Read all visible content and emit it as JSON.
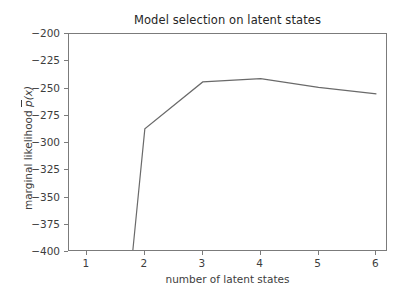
{
  "chart_data": {
    "type": "line",
    "title": "Model selection on latent states",
    "xlabel": "number of latent states",
    "ylabel": "marginal likelihood p̄(x)",
    "ylabel_parts": {
      "prefix": "marginal likelihood ",
      "barred_symbol": "p",
      "suffix": "(x)"
    },
    "x": [
      1.79,
      2,
      3,
      4,
      5,
      6
    ],
    "values": [
      -400,
      -287,
      -244,
      -241,
      -249,
      -255
    ],
    "series": [
      {
        "name": "marginal likelihood",
        "x": [
          1.79,
          2,
          3,
          4,
          5,
          6
        ],
        "values": [
          -400,
          -287,
          -244,
          -241,
          -249,
          -255
        ]
      }
    ],
    "xlim": [
      0.69,
      6.2
    ],
    "ylim": [
      -400,
      -200
    ],
    "xticks": [
      1,
      2,
      3,
      4,
      5,
      6
    ],
    "xtick_labels": [
      "1",
      "2",
      "3",
      "4",
      "5",
      "6"
    ],
    "yticks": [
      -400,
      -375,
      -350,
      -325,
      -300,
      -275,
      -250,
      -225,
      -200
    ],
    "ytick_labels": [
      "−400",
      "−375",
      "−350",
      "−325",
      "−300",
      "−275",
      "−250",
      "−225",
      "−200"
    ],
    "grid": false,
    "legend": null,
    "line_color": "#6a6a6a",
    "line_width": 1.2,
    "frame_color": "#7b7b7b",
    "background": "#ffffff",
    "note": "Line continues below the bottom axis limit at the left end (clipped at y = -400)."
  }
}
